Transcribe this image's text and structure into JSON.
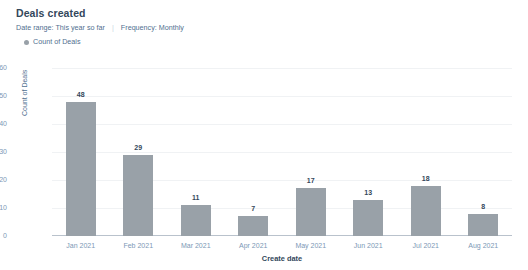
{
  "card": {
    "title": "Deals created",
    "subtitle": {
      "date_range": "Date range: This year so far",
      "separator": "|",
      "frequency": "Frequency: Monthly"
    },
    "legend": {
      "marker_icon": "circle-marker-icon",
      "label": "Count of Deals",
      "color": "#99a1a8"
    }
  },
  "chart_data": {
    "type": "bar",
    "title": "Deals created",
    "xlabel": "Create date",
    "ylabel": "Count of Deals",
    "categories": [
      "Jan 2021",
      "Feb 2021",
      "Mar 2021",
      "Apr 2021",
      "May 2021",
      "Jun 2021",
      "Jul 2021",
      "Aug 2021"
    ],
    "values": [
      48,
      29,
      11,
      7,
      17,
      13,
      18,
      8
    ],
    "series": [
      {
        "name": "Count of Deals",
        "color": "#99a1a8",
        "values": [
          48,
          29,
          11,
          7,
          17,
          13,
          18,
          8
        ]
      }
    ],
    "ylim": [
      0,
      60
    ],
    "yticks": [
      0,
      10,
      20,
      30,
      40,
      50,
      60
    ],
    "ytick_labels": [
      "0",
      "10",
      "20",
      "30",
      "40",
      "50",
      "60"
    ],
    "grid": true,
    "grid_color": "#f0f2f4",
    "legend_position": "top-left",
    "data_labels": true
  }
}
